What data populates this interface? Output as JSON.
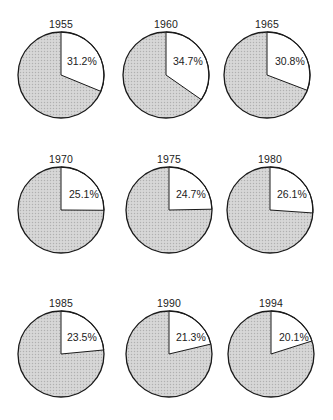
{
  "chart_data": {
    "type": "pie",
    "title": "",
    "layout": {
      "rows": 3,
      "cols": 3,
      "legend": "none"
    },
    "highlight_color": "#ffffff",
    "rest_color": "#d2d2d2",
    "stroke_color": "#1a1a1a",
    "charts": [
      {
        "label": "1955",
        "highlight_pct": 31.2,
        "highlight_text": "31.2%"
      },
      {
        "label": "1960",
        "highlight_pct": 34.7,
        "highlight_text": "34.7%"
      },
      {
        "label": "1965",
        "highlight_pct": 30.8,
        "highlight_text": "30.8%"
      },
      {
        "label": "1970",
        "highlight_pct": 25.1,
        "highlight_text": "25.1%"
      },
      {
        "label": "1975",
        "highlight_pct": 24.7,
        "highlight_text": "24.7%"
      },
      {
        "label": "1980",
        "highlight_pct": 26.1,
        "highlight_text": "26.1%"
      },
      {
        "label": "1985",
        "highlight_pct": 23.5,
        "highlight_text": "23.5%"
      },
      {
        "label": "1990",
        "highlight_pct": 21.3,
        "highlight_text": "21.3%"
      },
      {
        "label": "1994",
        "highlight_pct": 20.1,
        "highlight_text": "20.1%"
      }
    ]
  }
}
